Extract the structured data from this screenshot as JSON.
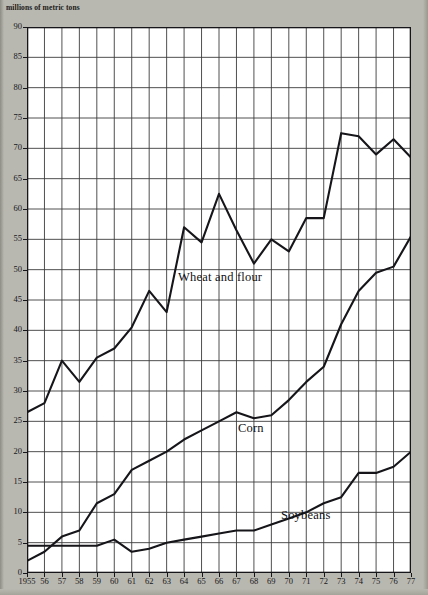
{
  "chart_data": {
    "type": "line",
    "title": "millions of metric tons",
    "xlabel": "",
    "ylabel": "millions of metric tons",
    "ylim": [
      0,
      90
    ],
    "ytick_step": 5,
    "grid": true,
    "legend": "inline-labels",
    "x": [
      1955,
      1956,
      1957,
      1958,
      1959,
      1960,
      1961,
      1962,
      1963,
      1964,
      1965,
      1966,
      1967,
      1968,
      1969,
      1970,
      1971,
      1972,
      1973,
      1974,
      1975,
      1976,
      1977
    ],
    "xtick_labels": [
      "1955",
      "56",
      "57",
      "58",
      "59",
      "60",
      "61",
      "62",
      "63",
      "64",
      "65",
      "66",
      "67",
      "68",
      "69",
      "70",
      "71",
      "72",
      "73",
      "74",
      "75",
      "76",
      "77"
    ],
    "ytick_labels": [
      "0",
      "5",
      "10",
      "15",
      "20",
      "25",
      "30",
      "35",
      "40",
      "45",
      "50",
      "55",
      "60",
      "65",
      "70",
      "75",
      "80",
      "85",
      "90"
    ],
    "series": [
      {
        "name": "Wheat and flour",
        "values": [
          26.5,
          28.0,
          35.0,
          31.5,
          35.5,
          37.0,
          40.5,
          46.5,
          43.0,
          57.0,
          54.5,
          62.5,
          56.5,
          51.0,
          55.0,
          53.0,
          58.5,
          58.5,
          72.5,
          72.0,
          69.0,
          71.5,
          68.5
        ]
      },
      {
        "name": "Corn",
        "values": [
          4.5,
          4.5,
          4.5,
          4.5,
          4.5,
          5.5,
          3.5,
          4.0,
          5.0,
          5.5,
          6.0,
          6.5,
          7.0,
          7.0,
          8.0,
          9.0,
          10.0,
          11.5,
          12.5,
          16.5,
          16.5,
          17.5,
          20.0
        ]
      },
      {
        "name": "Soybeans",
        "values": [
          2.0,
          3.5,
          6.0,
          7.0,
          11.5,
          13.0,
          17.0,
          18.5,
          20.0,
          22.0,
          23.5,
          25.0,
          26.5,
          25.5,
          26.0,
          28.5,
          31.5,
          34.0,
          41.0,
          46.5,
          49.5,
          50.5,
          55.5
        ]
      }
    ]
  },
  "labels": {
    "wheat": "Wheat and flour",
    "corn": "Corn",
    "soybeans": "Soybeans"
  },
  "colors": {
    "paper": "#b9b8b0",
    "plot_background": "#ffffff",
    "grid": "#3c3c3c",
    "line": "#16161a",
    "text": "#17171a"
  }
}
